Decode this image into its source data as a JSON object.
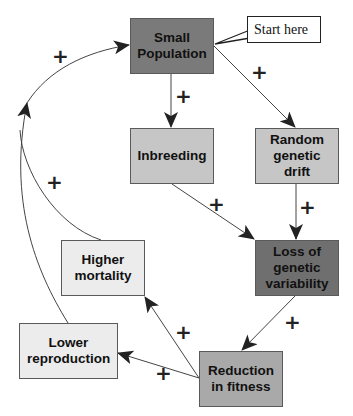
{
  "diagram": {
    "type": "causal-loop",
    "nodes": [
      {
        "id": "small_population",
        "label": "Small Population",
        "fill": "#7a7a7a"
      },
      {
        "id": "inbreeding",
        "label": "Inbreeding",
        "fill": "#c6c6c6"
      },
      {
        "id": "random_drift",
        "label": "Random genetic drift",
        "fill": "#c6c6c6"
      },
      {
        "id": "loss_variability",
        "label": "Loss of genetic variability",
        "fill": "#6f6f6f"
      },
      {
        "id": "higher_mortality",
        "label": "Higher mortality",
        "fill": "#ececec"
      },
      {
        "id": "lower_reproduction",
        "label": "Lower reproduction",
        "fill": "#ececec"
      },
      {
        "id": "reduction_fitness",
        "label": "Reduction in fitness",
        "fill": "#a9a9a9"
      }
    ],
    "edges": [
      {
        "from": "small_population",
        "to": "inbreeding",
        "sign": "+"
      },
      {
        "from": "small_population",
        "to": "random_drift",
        "sign": "+"
      },
      {
        "from": "inbreeding",
        "to": "loss_variability",
        "sign": "+"
      },
      {
        "from": "random_drift",
        "to": "loss_variability",
        "sign": "+"
      },
      {
        "from": "loss_variability",
        "to": "reduction_fitness",
        "sign": "+"
      },
      {
        "from": "reduction_fitness",
        "to": "higher_mortality",
        "sign": "+"
      },
      {
        "from": "reduction_fitness",
        "to": "lower_reproduction",
        "sign": "+"
      },
      {
        "from": "higher_mortality",
        "to": "small_population",
        "sign": "+"
      },
      {
        "from": "lower_reproduction",
        "to": "small_population",
        "sign": "+"
      }
    ],
    "callout": {
      "label": "Start here",
      "target": "small_population"
    },
    "sign_symbol": "+"
  }
}
